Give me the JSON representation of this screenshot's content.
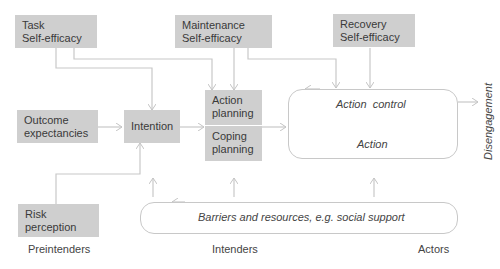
{
  "nodes": {
    "task_self_efficacy": "Task\nSelf-efficacy",
    "maintenance_self_efficacy": "Maintenance\nSelf-efficacy",
    "recovery_self_efficacy": "Recovery\nSelf-efficacy",
    "outcome_expectancies": "Outcome\nexpectancies",
    "intention": "Intention",
    "action_planning": "Action\nplanning",
    "coping_planning": "Coping\nplanning",
    "action_control": "Action  control",
    "action": "Action",
    "risk_perception": "Risk\nperception",
    "barriers": "Barriers and resources, e.g. social support",
    "disengagement": "Disengagement"
  },
  "stages": {
    "preintenders": "Preintenders",
    "intenders": "Intenders",
    "actors": "Actors"
  },
  "colors": {
    "box_fill": "#cfcfcf",
    "arrow": "#c4c4c4",
    "text": "#3a3a3a"
  }
}
